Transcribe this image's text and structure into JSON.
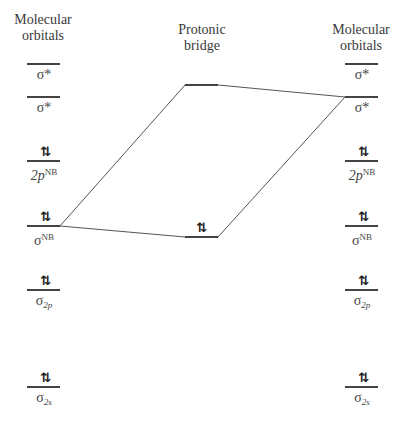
{
  "headers": {
    "left": [
      "Molecular",
      "orbitals"
    ],
    "center": [
      "Protonic",
      "bridge"
    ],
    "right": [
      "Molecular",
      "orbitals"
    ]
  },
  "electron_pair_symbol": "⇅",
  "columns": {
    "left": [
      {
        "label": "σ*",
        "y": 64,
        "occupied": false
      },
      {
        "label": "σ*",
        "y": 97,
        "occupied": false
      },
      {
        "label": "2p",
        "sup": "NB",
        "y": 161,
        "occupied": true
      },
      {
        "label": "σ",
        "sup": "NB",
        "y": 226,
        "occupied": true
      },
      {
        "label": "σ",
        "sub": "2p",
        "y": 290,
        "occupied": true
      },
      {
        "label": "σ",
        "sub": "2s",
        "y": 387,
        "occupied": true
      }
    ],
    "center": [
      {
        "label": "",
        "y": 85,
        "occupied": false
      },
      {
        "label": "",
        "y": 237,
        "occupied": true
      }
    ],
    "right": [
      {
        "label": "σ*",
        "y": 64,
        "occupied": false
      },
      {
        "label": "σ*",
        "y": 97,
        "occupied": false
      },
      {
        "label": "2p",
        "sup": "NB",
        "y": 161,
        "occupied": true
      },
      {
        "label": "σ",
        "sup": "NB",
        "y": 226,
        "occupied": true
      },
      {
        "label": "σ",
        "sub": "2p",
        "y": 290,
        "occupied": true
      },
      {
        "label": "σ",
        "sub": "2s",
        "y": 387,
        "occupied": true
      }
    ]
  },
  "labels": {
    "l_sigstar1": "σ*",
    "l_sigstar2": "σ*",
    "l_2p": "2p",
    "l_2p_sup": "NB",
    "l_signb": "σ",
    "l_signb_sup": "NB",
    "l_sig2p": "σ",
    "l_sig2p_sub": "2p",
    "l_sig2s": "σ",
    "l_sig2s_sub": "2s"
  },
  "correlation_lines": [
    {
      "from": "left.sigma_NB",
      "to": "center.upper"
    },
    {
      "from": "left.sigma_NB",
      "to": "center.lower"
    },
    {
      "from": "center.upper",
      "to": "right.sigma_star_lower"
    },
    {
      "from": "center.lower",
      "to": "right.sigma_star_lower"
    }
  ]
}
